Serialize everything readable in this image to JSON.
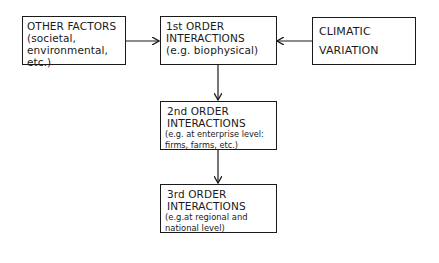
{
  "diagram": {
    "type": "flowchart",
    "nodes": {
      "other_factors": {
        "line1": "OTHER FACTORS",
        "line2": "(societal,",
        "line3": "environmental,",
        "line4": "etc.)"
      },
      "first_order": {
        "line1": "1st ORDER",
        "line2": "INTERACTIONS",
        "line3": "(e.g. biophysical)"
      },
      "climatic": {
        "line1": "CLIMATIC",
        "line2": "VARIATION"
      },
      "second_order": {
        "line1": "2nd ORDER",
        "line2": "INTERACTIONS",
        "line3": "(e.g. at enterprise level:",
        "line4": "firms, farms, etc.)"
      },
      "third_order": {
        "line1": "3rd ORDER",
        "line2": "INTERACTIONS",
        "line3": "(e.g.at regional and",
        "line4": "national level)"
      }
    },
    "edges": [
      {
        "from": "other_factors",
        "to": "first_order"
      },
      {
        "from": "climatic",
        "to": "first_order"
      },
      {
        "from": "first_order",
        "to": "second_order"
      },
      {
        "from": "second_order",
        "to": "third_order"
      }
    ],
    "colors": {
      "line": "#1a1a1a",
      "background": "#ffffff"
    }
  }
}
